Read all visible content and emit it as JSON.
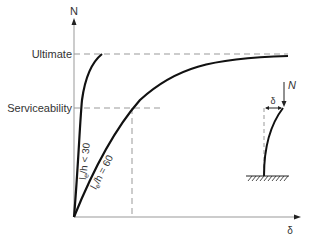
{
  "diagram": {
    "y_axis_label": "N",
    "x_axis_label": "δ",
    "levels": {
      "ultimate": "Ultimate",
      "serviceability": "Serviceability"
    },
    "curves": [
      {
        "label_main": "l",
        "label_sub": "e",
        "label_rest": "/h < 30"
      },
      {
        "label_main": "l",
        "label_sub": "e",
        "label_rest": "/h = 60"
      }
    ],
    "inset": {
      "load_label": "N",
      "deflection_label": "δ"
    }
  }
}
